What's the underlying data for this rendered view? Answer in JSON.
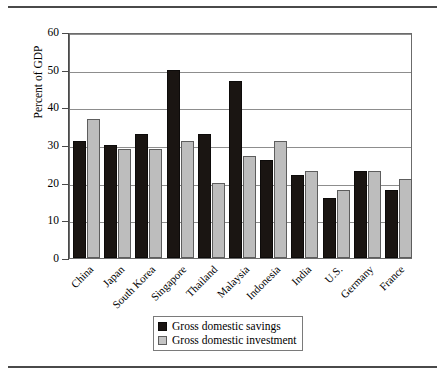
{
  "chart_data": {
    "type": "bar",
    "title": "",
    "xlabel": "",
    "ylabel": "Percent of GDP",
    "ylim": [
      0,
      60
    ],
    "yticks": [
      0,
      10,
      20,
      30,
      40,
      50,
      60
    ],
    "grid": true,
    "legend_position": "bottom-center",
    "categories": [
      "China",
      "Japan",
      "South Korea",
      "Singapore",
      "Thailand",
      "Malaysia",
      "Indonesia",
      "India",
      "U.S.",
      "Germany",
      "France"
    ],
    "series": [
      {
        "name": "Gross domestic savings",
        "color": "#1a1512",
        "values": [
          31,
          30,
          33,
          50,
          33,
          47,
          26,
          22,
          16,
          23,
          18
        ]
      },
      {
        "name": "Gross domestic investment",
        "color": "#bdbdbd",
        "values": [
          37,
          29,
          29,
          31,
          20,
          27,
          31,
          23,
          18,
          23,
          21
        ]
      }
    ]
  },
  "axis": {
    "y_title": "Percent of GDP",
    "y_tick_labels": [
      "60",
      "50",
      "40",
      "30",
      "20",
      "10",
      "0"
    ]
  },
  "legend": {
    "items": [
      {
        "label": "Gross domestic savings",
        "swatch": "black-square-icon"
      },
      {
        "label": "Gross domestic investment",
        "swatch": "gray-square-icon"
      }
    ]
  },
  "colors": {
    "savings": "#1a1512",
    "investment": "#bdbdbd",
    "frame": "#6b6b6b",
    "grid": "#8d8d8d",
    "rule": "#4a4a4a"
  }
}
